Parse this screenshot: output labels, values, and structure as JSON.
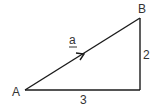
{
  "diagram": {
    "type": "right-triangle-vector",
    "vertices": {
      "A": {
        "label": "A"
      },
      "B": {
        "label": "B"
      }
    },
    "vector": {
      "label": "a",
      "underlined": true,
      "from": "A",
      "to": "B"
    },
    "sides": {
      "horizontal": {
        "label": "3"
      },
      "vertical": {
        "label": "2"
      }
    },
    "colors": {
      "line": "#1a1a1a",
      "text": "#333333",
      "background": "#ffffff"
    }
  }
}
